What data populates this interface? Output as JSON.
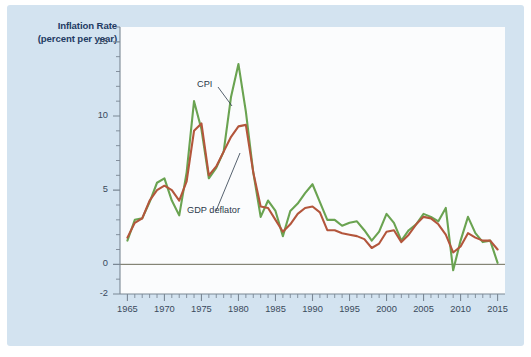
{
  "figure": {
    "background_color": "#d3e3f0",
    "plot_background_color": "#fbfcfd",
    "page_background_color": "#ffffff"
  },
  "axis_title": {
    "line1": "Inflation Rate",
    "line2": "(percent per year)"
  },
  "annotations": [
    {
      "name": "cpi",
      "text": "CPI"
    },
    {
      "name": "gdp-deflator",
      "text": "GDP deflator"
    }
  ],
  "chart_data": {
    "type": "line",
    "title": "Inflation Rate (percent per year)",
    "xlabel": "",
    "ylabel": "Inflation Rate (percent per year)",
    "xlim": [
      1964,
      2016
    ],
    "ylim": [
      -2,
      16
    ],
    "grid": false,
    "legend_position": "inline-annotation",
    "y_ticks": [
      -2,
      0,
      5,
      10,
      15
    ],
    "y_tick_labels": [
      "-2",
      "0",
      "5",
      "10",
      "15"
    ],
    "y_minor_tick_step": 1,
    "x_ticks": [
      1965,
      1970,
      1975,
      1980,
      1985,
      1990,
      1995,
      2000,
      2005,
      2010,
      2015
    ],
    "x_tick_labels": [
      "1965",
      "1970",
      "1975",
      "1980",
      "1985",
      "1990",
      "1995",
      "2000",
      "2005",
      "2010",
      "2015"
    ],
    "x_minor_tick_step": 1,
    "x": [
      1965,
      1966,
      1967,
      1968,
      1969,
      1970,
      1971,
      1972,
      1973,
      1974,
      1975,
      1976,
      1977,
      1978,
      1979,
      1980,
      1981,
      1982,
      1983,
      1984,
      1985,
      1986,
      1987,
      1988,
      1989,
      1990,
      1991,
      1992,
      1993,
      1994,
      1995,
      1996,
      1997,
      1998,
      1999,
      2000,
      2001,
      2002,
      2003,
      2004,
      2005,
      2006,
      2007,
      2008,
      2009,
      2010,
      2011,
      2012,
      2013,
      2014,
      2015
    ],
    "series": [
      {
        "name": "CPI",
        "color": "#6aa351",
        "values": [
          1.6,
          3.0,
          3.1,
          4.2,
          5.5,
          5.8,
          4.3,
          3.3,
          6.2,
          11.0,
          9.1,
          5.8,
          6.5,
          7.6,
          11.3,
          13.5,
          10.3,
          6.2,
          3.2,
          4.3,
          3.6,
          1.9,
          3.6,
          4.1,
          4.8,
          5.4,
          4.2,
          3.0,
          3.0,
          2.6,
          2.8,
          2.9,
          2.3,
          1.6,
          2.2,
          3.4,
          2.8,
          1.6,
          2.3,
          2.7,
          3.4,
          3.2,
          2.9,
          3.8,
          -0.4,
          1.6,
          3.2,
          2.1,
          1.5,
          1.6,
          0.1
        ]
      },
      {
        "name": "GDP deflator",
        "color": "#b3563c",
        "values": [
          1.8,
          2.8,
          3.1,
          4.3,
          5.0,
          5.3,
          5.0,
          4.3,
          5.6,
          9.0,
          9.5,
          6.0,
          6.6,
          7.6,
          8.6,
          9.3,
          9.4,
          6.2,
          3.9,
          3.8,
          3.0,
          2.2,
          2.7,
          3.4,
          3.8,
          3.9,
          3.5,
          2.3,
          2.3,
          2.1,
          2.0,
          1.9,
          1.7,
          1.1,
          1.4,
          2.2,
          2.3,
          1.5,
          2.0,
          2.7,
          3.2,
          3.1,
          2.7,
          2.0,
          0.8,
          1.2,
          2.1,
          1.8,
          1.6,
          1.6,
          1.0
        ]
      }
    ]
  }
}
